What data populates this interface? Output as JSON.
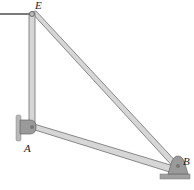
{
  "diagram": {
    "type": "truss-frame",
    "labels": {
      "E": "E",
      "A": "A",
      "B": "B"
    },
    "points": {
      "E": [
        32,
        14
      ],
      "A": [
        32,
        128
      ],
      "B": [
        178,
        170
      ]
    },
    "members": [
      {
        "from": "E",
        "to": "A"
      },
      {
        "from": "E",
        "to": "B"
      },
      {
        "from": "A",
        "to": "B"
      }
    ],
    "supports": {
      "A": "wall-pin",
      "B": "ground-pin"
    },
    "cable": {
      "from": "E",
      "direction": "left"
    },
    "colors": {
      "member_fill": "#d6d6d6",
      "member_edge": "#6e6e6e",
      "support_fill": "#9a9a9a",
      "wall_fill": "#b8b8b8",
      "cable": "#333333"
    }
  }
}
